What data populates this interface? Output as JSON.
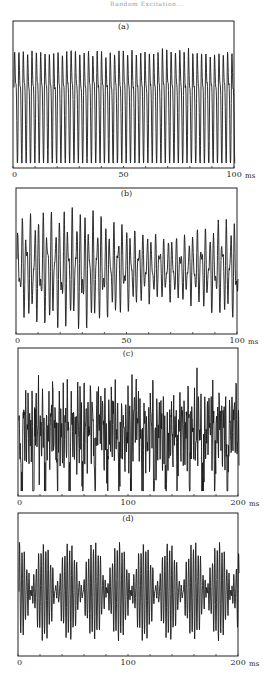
{
  "header": {
    "text": "Random Excitation..."
  },
  "chart_data": [
    {
      "type": "line",
      "panel_label": "(a)",
      "xlabel_unit": "ms",
      "xlim": [
        0,
        100
      ],
      "x_tick_labels": [
        "0",
        "50",
        "100"
      ],
      "x_tick_values": [
        0,
        50,
        100
      ],
      "minor_tick_step": 10,
      "description": "Periodic oscillation with regular tall peaks (~23 peaks over 100 ms), intermediate smaller oscillations",
      "signal": {
        "kind": "periodic",
        "f1": 0.23,
        "f2": 0.46,
        "a1": 1.0,
        "a2": 0.45,
        "noise": 0.05
      },
      "frame": {
        "x": 13,
        "y": 21,
        "w": 221,
        "h": 147
      }
    },
    {
      "type": "line",
      "panel_label": "(b)",
      "xlabel_unit": "ms",
      "xlim": [
        0,
        100
      ],
      "x_tick_labels": [
        "0",
        "50",
        "100"
      ],
      "x_tick_values": [
        0,
        50,
        100
      ],
      "minor_tick_step": 10,
      "description": "Quasi-periodic oscillation with varying amplitude peaks (~24 peaks over 100 ms)",
      "signal": {
        "kind": "quasiperiodic",
        "f1": 0.24,
        "f2": 0.383,
        "a1": 0.75,
        "a2": 0.45,
        "noise": 0.08
      },
      "frame": {
        "x": 16,
        "y": 188,
        "w": 221,
        "h": 146
      }
    },
    {
      "type": "line",
      "panel_label": "(c)",
      "xlabel_unit": "ms",
      "xlim": [
        0,
        200
      ],
      "x_tick_labels": [
        "0",
        "100",
        "200"
      ],
      "x_tick_values": [
        0,
        100,
        200
      ],
      "minor_tick_step": 20,
      "description": "Chaotic-looking broadband signal with irregular downward spikes",
      "signal": {
        "kind": "chaotic",
        "f1": 0.48,
        "f2": 0.77,
        "a1": 0.45,
        "a2": 0.35,
        "noise": 0.35
      },
      "frame": {
        "x": 18,
        "y": 348,
        "w": 220,
        "h": 148
      }
    },
    {
      "type": "line",
      "panel_label": "(d)",
      "xlabel_unit": "ms",
      "xlim": [
        0,
        200
      ],
      "x_tick_labels": [
        "0",
        "100",
        "200"
      ],
      "x_tick_values": [
        0,
        100,
        200
      ],
      "minor_tick_step": 20,
      "description": "Beating / amplitude-modulated oscillation with ~8 envelope lobes over 200 ms",
      "signal": {
        "kind": "beating",
        "f1": 0.42,
        "fenv": 0.04,
        "a1": 1.0,
        "a2": 0.0,
        "noise": 0.04
      },
      "frame": {
        "x": 18,
        "y": 513,
        "w": 220,
        "h": 143
      }
    }
  ]
}
